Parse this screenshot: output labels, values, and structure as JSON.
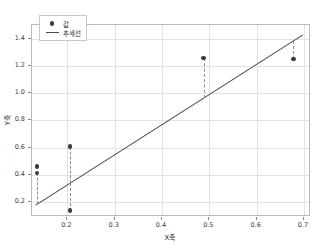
{
  "chart_data": {
    "type": "scatter",
    "title": "",
    "xlabel": "X축",
    "ylabel": "Y축",
    "xlim": [
      0.125,
      0.715
    ],
    "ylim": [
      0.09,
      1.5
    ],
    "grid": true,
    "legend_position": "upper left",
    "xticks": [
      "0.2",
      "0.3",
      "0.4",
      "0.5",
      "0.6",
      "0.7"
    ],
    "xtick_values": [
      0.2,
      0.3,
      0.4,
      0.5,
      0.6,
      0.7
    ],
    "yticks": [
      "0.2",
      "0.4",
      "0.6",
      "0.8",
      "1.0",
      "1.2",
      "1.4"
    ],
    "ytick_values": [
      0.2,
      0.4,
      0.6,
      0.8,
      1.0,
      1.2,
      1.4
    ],
    "series": [
      {
        "name": "값",
        "kind": "scatter",
        "color": "#3a3a3a",
        "x": [
          0.138,
          0.138,
          0.208,
          0.208,
          0.49,
          0.68
        ],
        "y": [
          0.455,
          0.405,
          0.6,
          0.13,
          1.25,
          1.245
        ]
      },
      {
        "name": "추세선",
        "kind": "line",
        "color": "#4a4a4a",
        "x": [
          0.135,
          0.7
        ],
        "y": [
          0.17,
          1.42
        ]
      }
    ],
    "residuals": [
      {
        "x": 0.138,
        "y_point": 0.405,
        "y_fit": 0.177
      },
      {
        "x": 0.208,
        "y_point": 0.6,
        "y_fit": 0.332
      },
      {
        "x": 0.208,
        "y_point": 0.13,
        "y_fit": 0.332
      },
      {
        "x": 0.49,
        "y_point": 1.25,
        "y_fit": 0.956
      },
      {
        "x": 0.68,
        "y_point": 1.245,
        "y_fit": 1.376
      }
    ],
    "legend": [
      {
        "label": "값",
        "marker": "circle"
      },
      {
        "label": "추세선",
        "marker": "line"
      }
    ]
  }
}
